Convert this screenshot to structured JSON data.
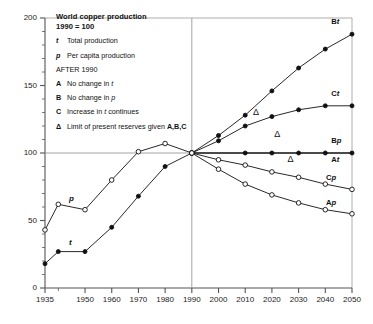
{
  "chart_data": {
    "type": "line",
    "title": "World copper production",
    "subtitle": "1990 = 100",
    "xlabel": "",
    "ylabel": "",
    "xlim": [
      1935,
      2050
    ],
    "ylim": [
      0,
      200
    ],
    "grid": false,
    "legend_position": "inside-top-left",
    "yticks": [
      0,
      50,
      100,
      150,
      200
    ],
    "ytick_labels": [
      "0",
      "50",
      "100",
      "150",
      "200"
    ],
    "yminor_step": 10,
    "xticks": [
      1935,
      1950,
      1960,
      1970,
      1980,
      1990,
      2000,
      2010,
      2020,
      2030,
      2040,
      2050
    ],
    "xtick_labels": [
      "1935",
      "1950",
      "1960",
      "1970",
      "1980",
      "1990",
      "2000",
      "2010",
      "2020",
      "2030",
      "2040",
      "2050"
    ],
    "reference_lines": [
      {
        "name": "baseline-100",
        "axis": "y",
        "value": 100
      },
      {
        "name": "divider-1990",
        "axis": "x",
        "value": 1990
      }
    ],
    "series": [
      {
        "name": "t",
        "label": "t",
        "description": "Total production, historical",
        "marker": "filled-circle",
        "x": [
          1935,
          1940,
          1950,
          1960,
          1970,
          1980,
          1990
        ],
        "values": [
          18,
          27,
          27,
          45,
          68,
          90,
          100
        ]
      },
      {
        "name": "p",
        "label": "p",
        "description": "Per capita production, historical",
        "marker": "open-circle",
        "x": [
          1935,
          1940,
          1950,
          1960,
          1970,
          1980,
          1990
        ],
        "values": [
          43,
          62,
          58,
          80,
          101,
          107,
          100
        ]
      },
      {
        "name": "Bt",
        "label": "Bt",
        "description": "Total production, scenario B (no change in p)",
        "marker": "filled-circle",
        "x": [
          1990,
          2000,
          2010,
          2020,
          2030,
          2040,
          2050
        ],
        "values": [
          100,
          113,
          128,
          146,
          163,
          177,
          188
        ]
      },
      {
        "name": "Ct",
        "label": "Ct",
        "description": "Total production, scenario C (increase in t continues)",
        "marker": "filled-circle",
        "x": [
          1990,
          2000,
          2010,
          2020,
          2030,
          2040,
          2050
        ],
        "values": [
          100,
          109,
          120,
          127,
          132,
          135,
          135
        ]
      },
      {
        "name": "Bp",
        "label": "Bp",
        "description": "Per capita production, scenario B (no change in p)",
        "marker": "filled-circle",
        "x": [
          1990,
          2010,
          2020,
          2030,
          2040,
          2050
        ],
        "values": [
          100,
          100,
          100,
          100,
          100,
          100
        ]
      },
      {
        "name": "At",
        "label": "At",
        "description": "Total production, scenario A (no change in t)",
        "marker": "none",
        "x": [
          1990,
          2050
        ],
        "values": [
          100,
          100
        ]
      },
      {
        "name": "Cp",
        "label": "Cp",
        "description": "Per capita production, scenario C",
        "marker": "open-circle",
        "x": [
          1990,
          2000,
          2010,
          2020,
          2030,
          2040,
          2050
        ],
        "values": [
          100,
          95,
          91,
          86,
          82,
          77,
          73
        ]
      },
      {
        "name": "Ap",
        "label": "Ap",
        "description": "Per capita production, scenario A",
        "marker": "open-circle",
        "x": [
          1990,
          2000,
          2010,
          2020,
          2030,
          2040,
          2050
        ],
        "values": [
          100,
          88,
          77,
          69,
          63,
          58,
          55
        ]
      }
    ],
    "annotations": [
      {
        "name": "delta-Bt",
        "symbol": "Δ",
        "x": 2014,
        "y": 128,
        "note": "Limit of present reserves on Bt"
      },
      {
        "name": "delta-Ct",
        "symbol": "Δ",
        "x": 2022,
        "y": 112,
        "note": "Limit of present reserves on Ct"
      },
      {
        "name": "delta-At",
        "symbol": "Δ",
        "x": 2027,
        "y": 93,
        "note": "Limit of present reserves on At"
      }
    ]
  },
  "legend": {
    "title_line1": "World copper production",
    "title_line2": "1990 = 100",
    "entries": [
      {
        "key": "t",
        "key_italic": true,
        "text": "Total production"
      },
      {
        "key": "p",
        "key_italic": true,
        "text": "Per capita production"
      }
    ],
    "after_heading": "AFTER 1990",
    "scenarios": [
      {
        "key": "A",
        "key_italic": false,
        "text_pre": "No change in ",
        "text_em": "t",
        "text_post": ""
      },
      {
        "key": "B",
        "key_italic": false,
        "text_pre": "No change in ",
        "text_em": "p",
        "text_post": ""
      },
      {
        "key": "C",
        "key_italic": false,
        "text_pre": "Increase in ",
        "text_em": "t",
        "text_post": " continues"
      }
    ],
    "reserves": {
      "key": "Δ",
      "text_pre": "Limit of present reserves given ",
      "text_bold": "A,B,C"
    }
  },
  "curve_labels": [
    {
      "name": "Bt",
      "prefix": "B",
      "suffix": "t"
    },
    {
      "name": "Ct",
      "prefix": "C",
      "suffix": "t"
    },
    {
      "name": "Bp",
      "prefix": "B",
      "suffix": "p"
    },
    {
      "name": "At",
      "prefix": "A",
      "suffix": "t"
    },
    {
      "name": "Cp",
      "prefix": "C",
      "suffix": "p"
    },
    {
      "name": "Ap",
      "prefix": "A",
      "suffix": "p"
    }
  ],
  "inline_labels": [
    {
      "name": "p",
      "text": "p"
    },
    {
      "name": "t",
      "text": "t"
    }
  ],
  "colors": {
    "ink": "#111111",
    "axis": "#555555",
    "grid": "#999999",
    "background": "#ffffff"
  }
}
